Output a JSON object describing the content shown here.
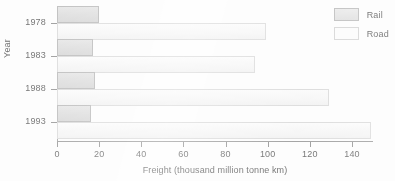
{
  "chart_data": {
    "type": "bar",
    "orientation": "horizontal",
    "title": "",
    "xlabel": "Freight (thousand million tonne km)",
    "ylabel": "Year",
    "categories": [
      "1978",
      "1983",
      "1988",
      "1993"
    ],
    "series": [
      {
        "name": "Rail",
        "values": [
          20,
          17,
          18,
          16
        ],
        "color": "#e0e0e0"
      },
      {
        "name": "Road",
        "values": [
          99,
          94,
          129,
          149
        ],
        "color": "#fafafa"
      }
    ],
    "xlim": [
      0,
      150
    ],
    "xticks": [
      0,
      20,
      40,
      60,
      80,
      100,
      120,
      140
    ],
    "xticklabels": [
      "0",
      "20",
      "40",
      "60",
      "80",
      "100",
      "120",
      "140"
    ],
    "grid": false,
    "legend_position": "top-right"
  },
  "legend": {
    "items": [
      {
        "label": "Rail",
        "swatch": "rail"
      },
      {
        "label": "Road",
        "swatch": "road"
      }
    ]
  },
  "axes": {
    "x_title": "Freight (thousand million tonne km)",
    "y_title": "Year"
  }
}
